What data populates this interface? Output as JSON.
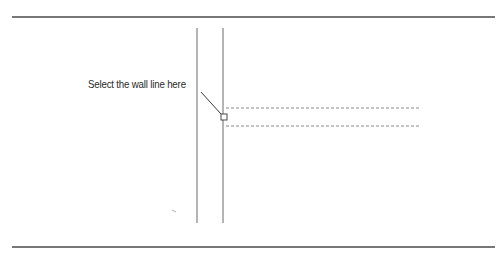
{
  "figure": {
    "callout_label": "Select the wall line here",
    "colors": {
      "rule": "#4a4a4a",
      "wall": "#6a6a6a",
      "dashed": "#8a8a8a",
      "leader": "#3a3a3a",
      "pickbox": "#4a4a4a",
      "background": "#ffffff"
    },
    "elements": {
      "top_rule": {
        "x1": 12,
        "y1": 17,
        "x2": 495,
        "y2": 17
      },
      "bottom_rule": {
        "x1": 12,
        "y1": 247,
        "x2": 495,
        "y2": 247
      },
      "wall_left": {
        "x": 197,
        "y1": 28,
        "y2": 223
      },
      "wall_right": {
        "x": 223,
        "y1": 28,
        "y2": 223
      },
      "dashed_upper": {
        "x1": 226,
        "x2": 421,
        "y": 108
      },
      "dashed_lower": {
        "x1": 226,
        "x2": 421,
        "y": 126
      },
      "pickbox": {
        "x": 221,
        "y": 114,
        "size": 6
      },
      "leader": {
        "x1": 201,
        "y1": 92,
        "x2": 222,
        "y2": 115
      }
    }
  }
}
